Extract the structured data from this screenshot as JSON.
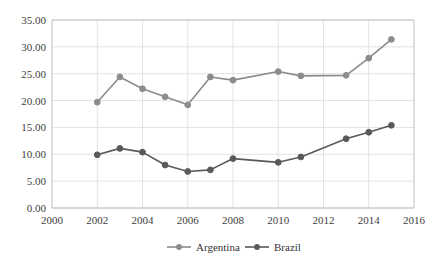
{
  "chart_data": {
    "type": "line",
    "title": "",
    "subtitle": "",
    "xlabel": "",
    "ylabel": "",
    "x": [
      2002,
      2003,
      2004,
      2005,
      2006,
      2007,
      2008,
      2009,
      2010,
      2011,
      2012,
      2013,
      2014,
      2015
    ],
    "series": [
      {
        "name": "Argentina",
        "color": "#8c8c8c",
        "marker": "circle",
        "values": [
          19.7,
          24.4,
          22.2,
          20.7,
          19.2,
          24.4,
          23.8,
          null,
          25.4,
          24.6,
          null,
          24.7,
          27.9,
          31.4
        ]
      },
      {
        "name": "Brazil",
        "color": "#595959",
        "marker": "circle",
        "values": [
          9.9,
          11.1,
          10.4,
          8.0,
          6.8,
          7.1,
          9.2,
          null,
          8.5,
          9.5,
          null,
          12.9,
          14.1,
          15.4
        ]
      }
    ],
    "xlim": [
      2000,
      2016
    ],
    "ylim": [
      0,
      35
    ],
    "xticks": [
      2000,
      2002,
      2004,
      2006,
      2008,
      2010,
      2012,
      2014,
      2016
    ],
    "xtick_labels": [
      "2000",
      "2002",
      "2004",
      "2006",
      "2008",
      "2010",
      "2012",
      "2014",
      "2016"
    ],
    "yticks": [
      0,
      5,
      10,
      15,
      20,
      25,
      30,
      35
    ],
    "ytick_labels": [
      "0.00",
      "5.00",
      "10.00",
      "15.00",
      "20.00",
      "25.00",
      "30.00",
      "35.00"
    ],
    "grid": {
      "horizontal": true,
      "vertical": true,
      "color": "#e2e2e2"
    },
    "legend": {
      "position": "bottom",
      "entries": [
        {
          "label": "Argentina",
          "color": "#8c8c8c"
        },
        {
          "label": "Brazil",
          "color": "#595959"
        }
      ]
    },
    "axis_color": "#bfbfbf",
    "text_color": "#404040"
  }
}
